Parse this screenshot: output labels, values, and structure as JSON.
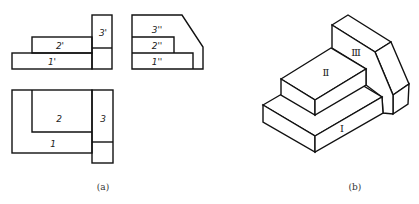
{
  "figure_a": {
    "caption": "(a)",
    "front_view": {
      "labels": [
        "1'",
        "2'",
        "3'"
      ]
    },
    "side_view": {
      "labels": [
        "1''",
        "2''",
        "3''"
      ]
    },
    "top_view": {
      "labels": [
        "1",
        "2",
        "3"
      ]
    }
  },
  "figure_b": {
    "caption": "(b)",
    "isometric_labels": [
      "Ⅰ",
      "Ⅱ",
      "Ⅲ"
    ]
  }
}
